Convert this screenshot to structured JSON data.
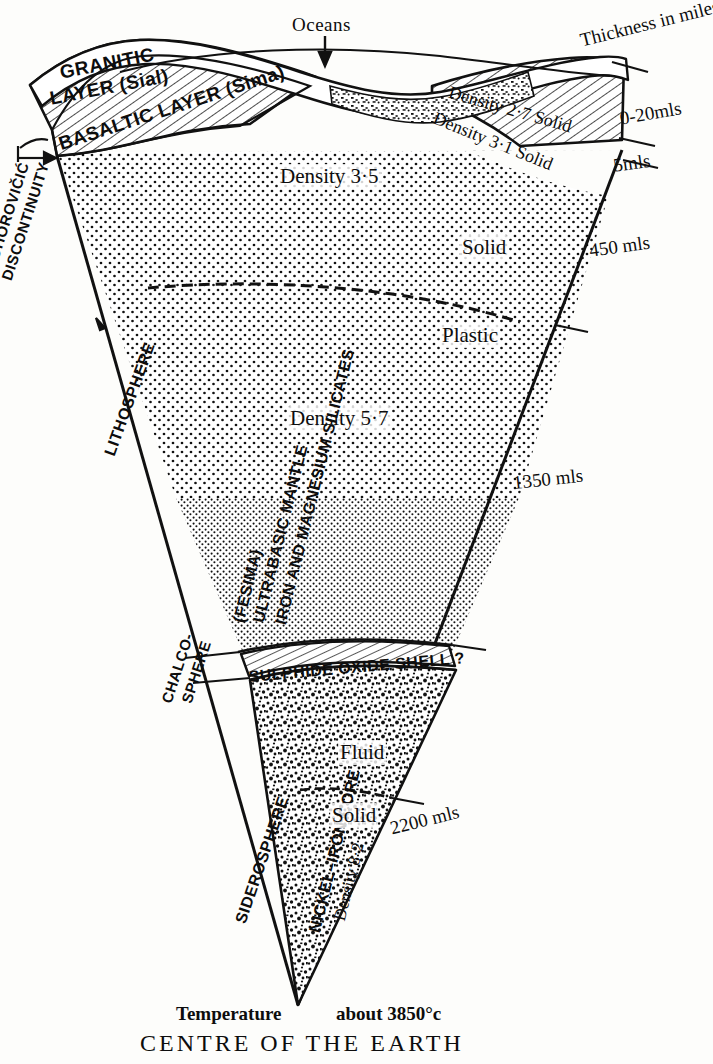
{
  "figure": {
    "title_bottom": "CENTRE OF THE EARTH",
    "temperature_label": "Temperature",
    "temperature_value": "about 3850°c",
    "ocean_label": "Oceans",
    "scale_header": "Thickness in miles"
  },
  "crust": {
    "granitic_line1": "GRANITIC",
    "granitic_line2": "LAYER (Sial)",
    "basaltic": "BASALTIC LAYER (Sima)",
    "granitic_density": "Density 2·7 Solid",
    "basaltic_density": "Density 3·1 Solid"
  },
  "mantle": {
    "name_line1": "ULTRABASIC MANTLE (FESIMA)",
    "name_line2": "IRON AND MAGNESIUM SILICATES",
    "fesima": "(FESIMA)",
    "mantle_caps": "ULTRABASIC MANTLE",
    "silicates_caps": "IRON AND MAGNESIUM SILICATES",
    "density_upper": "Density 3·5",
    "density_lower": "Density 5·7",
    "state_solid": "Solid",
    "state_plastic": "Plastic"
  },
  "boundaries": {
    "moho_line1": "MOHOROVIČIĆ",
    "moho_line2": "DISCONTINUITY",
    "lithosphere": "LITHOSPHERE",
    "chalco_line1": "CHALCO-",
    "chalco_line2": "SPHERE",
    "siderosphere": "SIDEROSPHERE"
  },
  "shell": {
    "sulphide_oxide": "SULPHIDE OXIDE SHELL ?"
  },
  "core": {
    "name": "NICKEL–IRON CORE",
    "density": "Density 8·2",
    "state_fluid": "Fluid",
    "state_solid": "Solid"
  },
  "depths": [
    {
      "name": "crust-granitic-thickness",
      "value": "0-20mls"
    },
    {
      "name": "crust-basaltic-thickness",
      "value": "5mls"
    },
    {
      "name": "mantle-solid-depth",
      "value": "450 mls"
    },
    {
      "name": "mantle-plastic-depth",
      "value": "1350 mls"
    },
    {
      "name": "core-depth",
      "value": "2200 mls"
    }
  ],
  "colors": {
    "ink": "#111111",
    "paper": "#fdfdfb"
  }
}
